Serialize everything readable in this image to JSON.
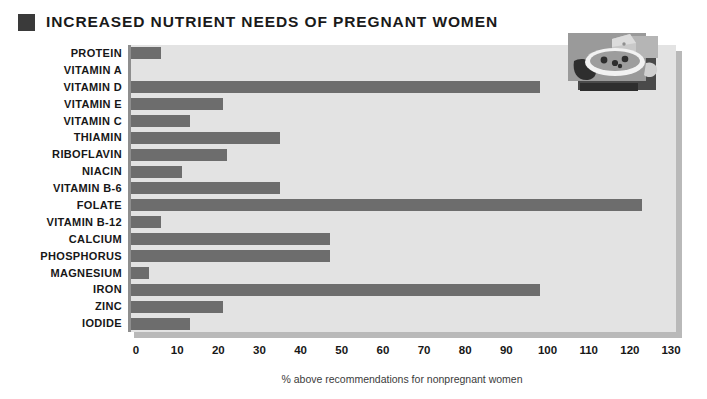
{
  "header": {
    "title": "INCREASED NUTRIENT NEEDS OF PREGNANT WOMEN",
    "marker_icon": "square-bullet-icon"
  },
  "decoration": {
    "image_name": "food-plate-illustration",
    "description": "plate of food with cheese wedge and fruit"
  },
  "colors": {
    "bar": "#6d6d6d",
    "plot_background": "#e3e3e3",
    "plot_shadow": "#b9b9b9",
    "axis_line": "#8e8e8e",
    "title_marker": "#3a3a3a",
    "page_background": "#ffffff"
  },
  "chart_data": {
    "type": "bar",
    "orientation": "horizontal",
    "title": "INCREASED NUTRIENT NEEDS OF PREGNANT WOMEN",
    "xlabel": "% above recommendations for nonpregnant women",
    "ylabel": "",
    "xlim": [
      0,
      130
    ],
    "xticks": [
      0,
      10,
      20,
      30,
      40,
      50,
      60,
      70,
      80,
      90,
      100,
      110,
      120,
      130
    ],
    "grid": false,
    "legend": null,
    "categories": [
      "PROTEIN",
      "VITAMIN A",
      "VITAMIN D",
      "VITAMIN E",
      "VITAMIN C",
      "THIAMIN",
      "RIBOFLAVIN",
      "NIACIN",
      "VITAMIN B-6",
      "FOLATE",
      "VITAMIN B-12",
      "CALCIUM",
      "PHOSPHORUS",
      "MAGNESIUM",
      "IRON",
      "ZINC",
      "IODIDE"
    ],
    "values": [
      8,
      0,
      100,
      23,
      15,
      37,
      24,
      13,
      37,
      125,
      8,
      49,
      49,
      5,
      100,
      23,
      15
    ]
  }
}
